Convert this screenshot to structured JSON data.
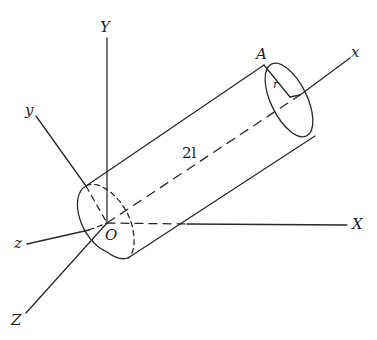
{
  "figure": {
    "labels": {
      "Y": "Y",
      "y": "y",
      "z": "z",
      "Z": "Z",
      "X": "X",
      "x": "x",
      "O": "O",
      "A": "A",
      "r": "r",
      "length": "2l"
    },
    "colors": {
      "stroke": "#2a2a2a",
      "background": "#ffffff"
    }
  }
}
